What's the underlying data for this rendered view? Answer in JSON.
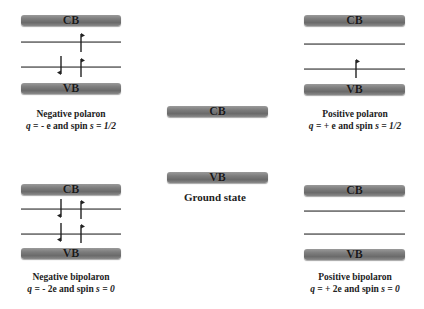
{
  "diagram": {
    "panels": [
      {
        "id": "negative-polaron",
        "cb_label": "CB",
        "vb_label": "VB",
        "title": "Negative polaron",
        "charge_prefix": "q",
        "charge_text": " = - e and spin ",
        "spin_symbol": "s",
        "spin_value": " = 1/2",
        "upper_level_spins": [
          "up"
        ],
        "lower_level_spins": [
          "down",
          "up"
        ]
      },
      {
        "id": "positive-polaron",
        "cb_label": "CB",
        "vb_label": "VB",
        "title": "Positive polaron",
        "charge_prefix": "q",
        "charge_text": " = + e and spin ",
        "spin_symbol": "s",
        "spin_value": " = 1/2",
        "upper_level_spins": [],
        "lower_level_spins": [
          "up"
        ]
      },
      {
        "id": "ground-state",
        "cb_label": "CB",
        "vb_label": "VB",
        "title": "Ground state"
      },
      {
        "id": "negative-bipolaron",
        "cb_label": "CB",
        "vb_label": "VB",
        "title": "Negative bipolaron",
        "charge_prefix": "q",
        "charge_text": " = - 2e and spin ",
        "spin_symbol": "s",
        "spin_value": " = 0",
        "upper_level_spins": [
          "down",
          "up"
        ],
        "lower_level_spins": [
          "down",
          "up"
        ]
      },
      {
        "id": "positive-bipolaron",
        "cb_label": "CB",
        "vb_label": "VB",
        "title": "Positive bipolaron",
        "charge_prefix": "q",
        "charge_text": " = + 2e and spin ",
        "spin_symbol": "s",
        "spin_value": " = 0",
        "upper_level_spins": [],
        "lower_level_spins": []
      }
    ],
    "colors": {
      "band_fill": "#7d7d7d",
      "level_line": "#888888",
      "arrow": "#222222",
      "text": "#222222"
    }
  }
}
